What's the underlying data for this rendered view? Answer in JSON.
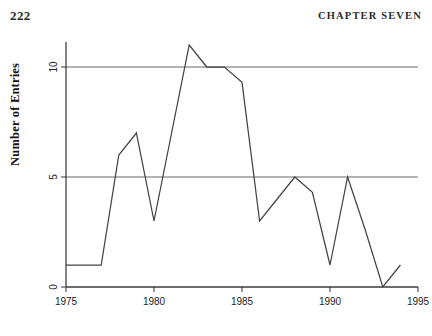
{
  "header": {
    "folio": "222",
    "chapter_title": "CHAPTER SEVEN"
  },
  "colors": {
    "ink": "#1a1a1a",
    "axis": "#333333",
    "gridline": "#555555",
    "series_line": "#444444",
    "background": "#ffffff"
  },
  "chart_data": {
    "type": "line",
    "title": "",
    "xlabel": "",
    "ylabel": "Number of Entries",
    "xlim": [
      1975,
      1995
    ],
    "ylim": [
      0,
      11.6
    ],
    "xticks": [
      1975,
      1980,
      1985,
      1990,
      1995
    ],
    "xtick_labels": [
      "1975",
      "1980",
      "1985",
      "1990",
      "1995"
    ],
    "yticks": [
      0,
      5,
      10
    ],
    "ytick_labels": [
      "0",
      "5",
      "10"
    ],
    "grid": true,
    "gridlines_y": [
      0,
      5,
      10
    ],
    "legend": false,
    "series": [
      {
        "name": "Number of Entries",
        "x": [
          1975,
          1976,
          1977,
          1978,
          1979,
          1980,
          1981,
          1982,
          1983,
          1984,
          1985,
          1986,
          1987,
          1988,
          1989,
          1990,
          1991,
          1992,
          1993,
          1994
        ],
        "values": [
          1,
          1,
          1,
          6,
          7,
          3,
          7,
          11,
          10,
          10,
          9.3,
          3,
          4,
          5,
          4.3,
          1,
          5,
          2.6,
          0,
          1
        ]
      }
    ]
  }
}
